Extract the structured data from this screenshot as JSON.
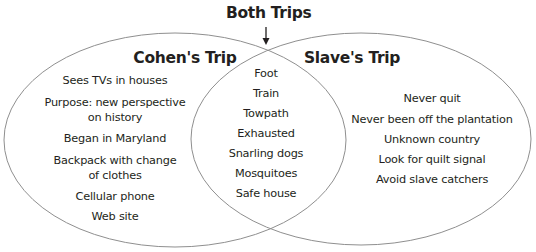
{
  "diagram": {
    "type": "venn",
    "header": "Both Trips",
    "colors": {
      "outline": "#8f8f8f",
      "text": "#231f20",
      "background": "#ffffff"
    },
    "left": {
      "title": "Cohen's Trip",
      "items": [
        "Sees TVs in houses",
        "Purpose: new perspective",
        "on history",
        "Began in Maryland",
        "Backpack with change",
        "of clothes",
        "Cellular phone",
        "Web site"
      ]
    },
    "center": {
      "items": [
        "Foot",
        "Train",
        "Towpath",
        "Exhausted",
        "Snarling dogs",
        "Mosquitoes",
        "Safe house"
      ]
    },
    "right": {
      "title": "Slave's Trip",
      "items": [
        "Never quit",
        "Never been off the plantation",
        "Unknown country",
        "Look for quilt signal",
        "Avoid slave catchers"
      ]
    }
  }
}
